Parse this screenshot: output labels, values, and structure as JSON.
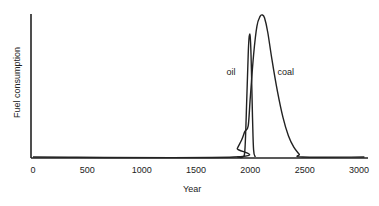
{
  "chart_data": {
    "type": "line",
    "title": "",
    "xlabel": "Year",
    "ylabel": "Fuel consumption",
    "xlim": [
      0,
      3050
    ],
    "ylim": [
      0,
      1
    ],
    "grid": false,
    "x_ticks": [
      0,
      500,
      1000,
      1500,
      2000,
      2500,
      3000
    ],
    "x_tick_labels": [
      "0",
      "500",
      "1000",
      "1500",
      "2000",
      "2500",
      "3000"
    ],
    "y_ticks": [],
    "series": [
      {
        "name": "coal",
        "x": [
          0,
          1850,
          1880,
          1920,
          1950,
          1980,
          2000,
          2030,
          2060,
          2090,
          2110,
          2130,
          2160,
          2200,
          2250,
          2300,
          2350,
          2400,
          2450,
          2480,
          3050
        ],
        "y": [
          0,
          0,
          0.06,
          0.12,
          0.18,
          0.22,
          0.42,
          0.72,
          0.92,
          0.99,
          1.0,
          0.98,
          0.88,
          0.68,
          0.46,
          0.28,
          0.15,
          0.07,
          0.02,
          0,
          0
        ]
      },
      {
        "name": "oil",
        "x": [
          1880,
          1930,
          1950,
          1965,
          1980,
          1990,
          2000,
          2010,
          2020,
          2030,
          2045
        ],
        "y": [
          0,
          0,
          0.05,
          0.35,
          0.72,
          0.85,
          0.84,
          0.62,
          0.28,
          0.05,
          0
        ]
      }
    ],
    "annotations": [
      {
        "text": "oil",
        "x": 1780,
        "y": 0.6
      },
      {
        "text": "coal",
        "x": 2250,
        "y": 0.6
      }
    ]
  }
}
